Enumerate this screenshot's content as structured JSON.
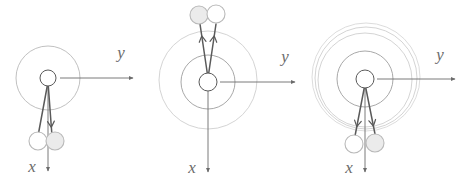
{
  "figure": {
    "background_color": "#ffffff",
    "stroke_dark": "#5a5a5a",
    "stroke_light": "#b9b9b9",
    "stroke_faint": "#cfcfcf",
    "bob_fill_open": "#ffffff",
    "bob_fill_shaded": "#ebebeb",
    "label_color": "#6b6b6b"
  },
  "panels": [
    {
      "id": "panel-left",
      "name": "left-panel",
      "hub": {
        "cx": 48,
        "cy": 78,
        "r": 8
      },
      "orbit_circles": [
        {
          "cx": 48,
          "cy": 78,
          "r": 32,
          "color": "#b9b9b9"
        }
      ],
      "axes": {
        "y": {
          "label": "y",
          "label_x": 121,
          "label_y": 58,
          "from_x": 60,
          "from_y": 78,
          "to_x": 133,
          "to_y": 78
        },
        "x": {
          "label": "x",
          "label_x": 32,
          "label_y": 172,
          "from_x": 48,
          "from_y": 86,
          "to_x": 48,
          "to_y": 171
        }
      },
      "rods": [
        {
          "from_x": 48,
          "from_y": 82,
          "to_x": 38,
          "to_y": 136,
          "arrow": false
        },
        {
          "from_x": 48,
          "from_y": 82,
          "to_x": 52,
          "to_y": 136,
          "arrow": true,
          "arrow_t": 0.84
        }
      ],
      "bobs": [
        {
          "cx": 38,
          "cy": 141,
          "r": 9,
          "fill": "#ffffff"
        },
        {
          "cx": 55,
          "cy": 141,
          "r": 9,
          "fill": "#ebebeb"
        }
      ]
    },
    {
      "id": "panel-center",
      "name": "center-panel",
      "hub": {
        "cx": 208,
        "cy": 82,
        "r": 9
      },
      "orbit_circles": [
        {
          "cx": 208,
          "cy": 82,
          "r": 27,
          "color": "#9e9e9e"
        },
        {
          "cx": 208,
          "cy": 80,
          "r": 49,
          "color": "#cfcfcf"
        }
      ],
      "axes": {
        "y": {
          "label": "y",
          "label_x": 285,
          "label_y": 62,
          "from_x": 220,
          "from_y": 82,
          "to_x": 295,
          "to_y": 82
        },
        "x": {
          "label": "x",
          "label_x": 192,
          "label_y": 173,
          "from_x": 208,
          "from_y": 91,
          "to_x": 208,
          "to_y": 172
        }
      },
      "rods": [
        {
          "from_x": 208,
          "from_y": 78,
          "to_x": 200,
          "to_y": 24,
          "arrow": true,
          "arrow_t": 0.78
        },
        {
          "from_x": 208,
          "from_y": 78,
          "to_x": 216,
          "to_y": 24,
          "arrow": true,
          "arrow_t": 0.78
        }
      ],
      "bobs": [
        {
          "cx": 199,
          "cy": 15,
          "r": 9,
          "fill": "#ebebeb"
        },
        {
          "cx": 216,
          "cy": 14,
          "r": 9,
          "fill": "#ffffff"
        }
      ]
    },
    {
      "id": "panel-right",
      "name": "right-panel",
      "hub": {
        "cx": 365,
        "cy": 79,
        "r": 9
      },
      "orbit_circles": [
        {
          "cx": 365,
          "cy": 79,
          "r": 28,
          "color": "#9e9e9e"
        },
        {
          "cx": 365,
          "cy": 80,
          "r": 47,
          "color": "#cfcfcf"
        },
        {
          "cx": 366,
          "cy": 78,
          "r": 51,
          "color": "#cfcfcf"
        },
        {
          "cx": 366,
          "cy": 77,
          "r": 54,
          "color": "#d8d8d8"
        }
      ],
      "axes": {
        "y": {
          "label": "y",
          "label_x": 440,
          "label_y": 60,
          "from_x": 377,
          "from_y": 79,
          "to_x": 455,
          "to_y": 79
        },
        "x": {
          "label": "x",
          "label_x": 349,
          "label_y": 173,
          "from_x": 365,
          "from_y": 88,
          "to_x": 365,
          "to_y": 172
        }
      },
      "rods": [
        {
          "from_x": 365,
          "from_y": 84,
          "to_x": 355,
          "to_y": 136,
          "arrow": true,
          "arrow_t": 0.82
        },
        {
          "from_x": 365,
          "from_y": 84,
          "to_x": 375,
          "to_y": 134,
          "arrow": true,
          "arrow_t": 0.84
        }
      ],
      "bobs": [
        {
          "cx": 354,
          "cy": 144,
          "r": 9,
          "fill": "#ffffff"
        },
        {
          "cx": 375,
          "cy": 143,
          "r": 9,
          "fill": "#ebebeb"
        }
      ]
    }
  ]
}
